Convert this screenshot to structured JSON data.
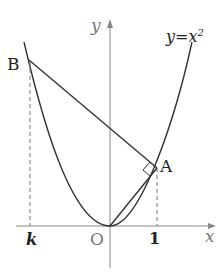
{
  "diagram": {
    "curve_label": "y=x²",
    "curve_label_main": "y=x",
    "curve_label_exp": "2",
    "axis_x_label": "x",
    "axis_y_label": "y",
    "origin_label": "O",
    "point_a_label": "A",
    "point_b_label": "B",
    "tick_k_label": "k",
    "tick_1_label": "1",
    "colors": {
      "curve": "#333333",
      "axis": "#888888",
      "dashed": "#777777"
    }
  }
}
